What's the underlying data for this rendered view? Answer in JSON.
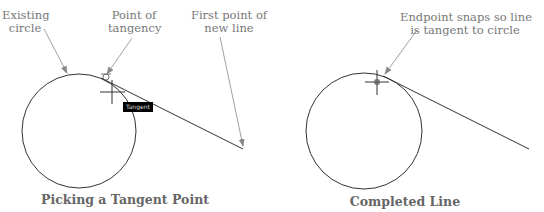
{
  "left_panel": {
    "labels": {
      "existing_circle": "Existing\ncircle",
      "point_of_tangency": "Point of\ntangency",
      "first_point": "First point of\nnew line"
    },
    "tooltip": "Tangent",
    "caption": "Picking a Tangent Point"
  },
  "right_panel": {
    "labels": {
      "endpoint_note": "Endpoint snaps so line\nis tangent to circle"
    },
    "caption": "Completed Line"
  },
  "colors": {
    "geometry": "#333333",
    "leader": "#888888",
    "label_text": "#777777",
    "tooltip_bg": "#000000"
  }
}
